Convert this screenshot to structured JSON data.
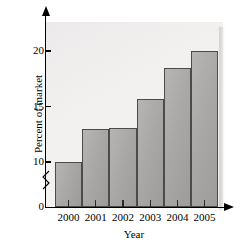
{
  "chart_data": {
    "type": "bar",
    "title": "",
    "xlabel": "Year",
    "ylabel": "Percent of market",
    "categories": [
      "2000",
      "2001",
      "2002",
      "2003",
      "2004",
      "2005"
    ],
    "values": [
      10.0,
      13.0,
      13.1,
      15.7,
      18.5,
      20.0
    ],
    "ylim": [
      0,
      21.5
    ],
    "y_ticks": [
      "0",
      "10",
      "15",
      "20"
    ],
    "y_tick_values": [
      0,
      10,
      15,
      20
    ],
    "axis_break": true,
    "axis_break_note": "zig-zag break on y-axis between 0 and 10",
    "grid": false,
    "legend": "none",
    "colors": {
      "bar_fill": "#a9a8a6",
      "bar_edge": "#4b4b4b",
      "plot_background": "#f1f0ef",
      "axis": "#000000",
      "text": "#000000"
    }
  },
  "axes": {
    "y_title": "Percent of market",
    "x_title": "Year",
    "y_tick_labels": [
      "20",
      "15",
      "10",
      "0"
    ],
    "x_tick_labels": [
      "2000",
      "2001",
      "2002",
      "2003",
      "2004",
      "2005"
    ]
  }
}
